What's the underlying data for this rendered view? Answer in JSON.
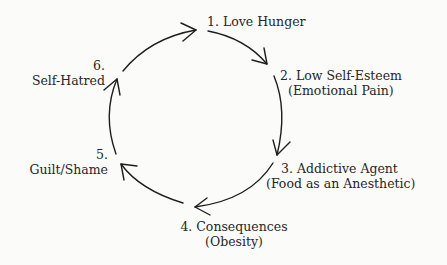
{
  "diagram": {
    "type": "cycle",
    "direction": "clockwise",
    "nodes": [
      {
        "number": "1.",
        "title": "1. Love Hunger",
        "subtitle": ""
      },
      {
        "number": "2.",
        "title": "2. Low Self-Esteem",
        "subtitle": "(Emotional Pain)"
      },
      {
        "number": "3.",
        "title": "3. Addictive Agent",
        "subtitle": "(Food as an Anesthetic)"
      },
      {
        "number": "4.",
        "title": "4. Consequences",
        "subtitle": "(Obesity)"
      },
      {
        "number": "5.",
        "title": "Guilt/Shame",
        "subtitle": ""
      },
      {
        "number": "6.",
        "title": "Self-Hatred",
        "subtitle": ""
      }
    ],
    "edges": [
      {
        "from": 1,
        "to": 2
      },
      {
        "from": 2,
        "to": 3
      },
      {
        "from": 3,
        "to": 4
      },
      {
        "from": 4,
        "to": 5
      },
      {
        "from": 5,
        "to": 6
      },
      {
        "from": 6,
        "to": 1
      }
    ],
    "colors": {
      "stroke": "#1e1e1e",
      "text": "#262626",
      "background": "#fbfbfa"
    }
  }
}
